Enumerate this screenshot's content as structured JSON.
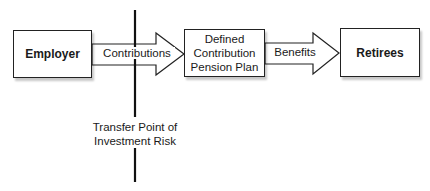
{
  "diagram": {
    "nodes": [
      {
        "id": "employer",
        "label": "Employer"
      },
      {
        "id": "dc_plan",
        "label_lines": [
          "Defined",
          "Contribution",
          "Pension Plan"
        ]
      },
      {
        "id": "retirees",
        "label": "Retirees"
      }
    ],
    "edges": [
      {
        "from": "employer",
        "to": "dc_plan",
        "label": "Contributions"
      },
      {
        "from": "dc_plan",
        "to": "retirees",
        "label": "Benefits"
      }
    ],
    "divider": {
      "label_lines": [
        "Transfer Point of",
        "Investment Risk"
      ]
    },
    "colors": {
      "stroke": "#222222",
      "fill": "#ffffff"
    }
  }
}
